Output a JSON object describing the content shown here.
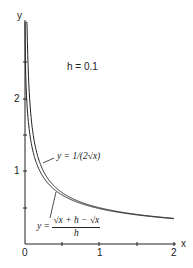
{
  "chart_data": {
    "type": "line",
    "title": "",
    "annotation": "h = 0.1",
    "xlabel": "x",
    "ylabel": "y",
    "xlim": [
      0,
      2
    ],
    "ylim": [
      0,
      2.4
    ],
    "x_ticks": [
      "0",
      "1",
      "2"
    ],
    "y_ticks": [
      "1",
      "2"
    ],
    "grid": false,
    "legend": "inline labels",
    "series": [
      {
        "name": "y = 1/(2√x)",
        "x": [
          0.05,
          0.1,
          0.15,
          0.2,
          0.3,
          0.4,
          0.5,
          0.75,
          1.0,
          1.25,
          1.5,
          1.75,
          2.0
        ],
        "values": [
          2.24,
          1.58,
          1.29,
          1.12,
          0.91,
          0.79,
          0.71,
          0.58,
          0.5,
          0.45,
          0.41,
          0.38,
          0.35
        ]
      },
      {
        "name": "y = (√(x+h) − √x)/h",
        "x": [
          0.0,
          0.05,
          0.1,
          0.15,
          0.2,
          0.3,
          0.4,
          0.5,
          0.75,
          1.0,
          1.25,
          1.5,
          1.75,
          2.0
        ],
        "values": [
          3.16,
          1.64,
          1.31,
          1.13,
          1.0,
          0.84,
          0.74,
          0.67,
          0.56,
          0.49,
          0.44,
          0.4,
          0.37,
          0.35
        ]
      }
    ]
  },
  "labels": {
    "y_axis": "y",
    "x_axis": "x",
    "h_annotation": "h = 0.1",
    "tick_x0": "0",
    "tick_x1": "1",
    "tick_x2": "2",
    "tick_y1": "1",
    "tick_y2": "2",
    "curve1_label": "y = 1/(2√x)",
    "curve2_lhs": "y =",
    "curve2_num": "√x + h − √x",
    "curve2_den": "h"
  }
}
